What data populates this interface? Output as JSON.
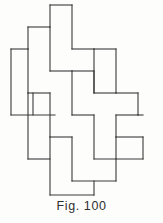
{
  "figure": {
    "caption": "Fig. 100",
    "title": "Fig. 100",
    "kind": "geometric-dissection-diagram",
    "background_color": "#fdfdfc",
    "stroke_color": "#3a3a3a",
    "stroke_width": 1.1,
    "fill_color": "none"
  },
  "canvas": {
    "width": 163,
    "height": 223,
    "drawing_bounds": {
      "left": 11,
      "top": 5,
      "right": 143,
      "bottom": 195
    },
    "grid_module": {
      "cell_width": 22,
      "cell_height": 22,
      "origin_x": 11,
      "origin_y": 5
    }
  },
  "chart_data": {
    "type": "diagram",
    "title": "Fig. 100",
    "subtitle": "",
    "xlabel": "",
    "ylabel": "",
    "grid": false,
    "legend": null,
    "units": "grid-cells of 22 x 22 px",
    "piece_count": 12,
    "piece_shape": "L-tetromino",
    "pieces": [
      {
        "id": "piece-1",
        "label": "top-centre",
        "points": "50,5 72,5 72,49 94,49 94,71 50,71"
      },
      {
        "id": "piece-2",
        "label": "upper-left-outer",
        "points": "28,27 50,27 50,71 72,71 72,93 28,93"
      },
      {
        "id": "piece-3",
        "label": "left-upper",
        "points": "11,49 33,49 33,93 55,93 55,115 11,115"
      },
      {
        "id": "piece-4",
        "label": "upper-right",
        "points": "94,49 116,49 116,93 138,93 138,115 94,115"
      },
      {
        "id": "piece-5",
        "label": "centre-upper",
        "points": "72,49 94,49 94,93 116,93 116,115 72,115"
      },
      {
        "id": "piece-6",
        "label": "centre-left",
        "points": "50,71 72,71 72,115 94,115 94,137 50,137"
      },
      {
        "id": "piece-7",
        "label": "left-lower",
        "points": "28,93 50,93 50,137 72,137 72,159 28,159"
      },
      {
        "id": "piece-8",
        "label": "centre-right",
        "points": "94,93 116,93 116,137 138,137 138,159 94,159"
      },
      {
        "id": "piece-9",
        "label": "right-mid",
        "points": "116,115 138,115 138,137 143,137 143,159 116,159"
      },
      {
        "id": "piece-10",
        "label": "centre-lower",
        "points": "72,115 94,115 94,159 116,159 116,181 72,181"
      },
      {
        "id": "piece-11",
        "label": "bottom-left",
        "points": "50,137 72,137 72,181 94,181 94,195 50,195"
      },
      {
        "id": "piece-12",
        "label": "bottom-centre",
        "points": "72,159 94,159 94,195 116,195 116,181 94,181"
      }
    ],
    "segments": [
      {
        "id": "s1",
        "x1": 50,
        "y1": 5,
        "x2": 72,
        "y2": 5
      },
      {
        "id": "s2",
        "x1": 50,
        "y1": 5,
        "x2": 50,
        "y2": 27
      },
      {
        "id": "s3",
        "x1": 72,
        "y1": 5,
        "x2": 72,
        "y2": 49
      },
      {
        "id": "s4",
        "x1": 28,
        "y1": 27,
        "x2": 50,
        "y2": 27
      },
      {
        "id": "s5",
        "x1": 28,
        "y1": 27,
        "x2": 28,
        "y2": 49
      },
      {
        "id": "s6",
        "x1": 50,
        "y1": 27,
        "x2": 50,
        "y2": 71
      },
      {
        "id": "s7",
        "x1": 11,
        "y1": 49,
        "x2": 28,
        "y2": 49
      },
      {
        "id": "s8",
        "x1": 11,
        "y1": 49,
        "x2": 11,
        "y2": 115
      },
      {
        "id": "s9",
        "x1": 28,
        "y1": 49,
        "x2": 28,
        "y2": 93
      },
      {
        "id": "s10",
        "x1": 72,
        "y1": 49,
        "x2": 94,
        "y2": 49
      },
      {
        "id": "s11",
        "x1": 94,
        "y1": 49,
        "x2": 94,
        "y2": 93
      },
      {
        "id": "s12",
        "x1": 94,
        "y1": 49,
        "x2": 116,
        "y2": 49
      },
      {
        "id": "s13",
        "x1": 116,
        "y1": 49,
        "x2": 116,
        "y2": 93
      },
      {
        "id": "s14",
        "x1": 50,
        "y1": 71,
        "x2": 72,
        "y2": 71
      },
      {
        "id": "s15",
        "x1": 72,
        "y1": 71,
        "x2": 72,
        "y2": 115
      },
      {
        "id": "s16",
        "x1": 28,
        "y1": 93,
        "x2": 50,
        "y2": 93
      },
      {
        "id": "s17",
        "x1": 50,
        "y1": 93,
        "x2": 50,
        "y2": 137
      },
      {
        "id": "s18",
        "x1": 94,
        "y1": 93,
        "x2": 116,
        "y2": 93
      },
      {
        "id": "s19",
        "x1": 116,
        "y1": 93,
        "x2": 138,
        "y2": 93
      },
      {
        "id": "s20",
        "x1": 138,
        "y1": 93,
        "x2": 138,
        "y2": 115
      },
      {
        "id": "s21",
        "x1": 11,
        "y1": 115,
        "x2": 55,
        "y2": 115
      },
      {
        "id": "s22",
        "x1": 72,
        "y1": 115,
        "x2": 94,
        "y2": 115
      },
      {
        "id": "s23",
        "x1": 94,
        "y1": 115,
        "x2": 94,
        "y2": 159
      },
      {
        "id": "s24",
        "x1": 116,
        "y1": 115,
        "x2": 138,
        "y2": 115
      },
      {
        "id": "s25",
        "x1": 116,
        "y1": 115,
        "x2": 116,
        "y2": 137
      },
      {
        "id": "s26",
        "x1": 138,
        "y1": 115,
        "x2": 143,
        "y2": 115
      },
      {
        "id": "s27",
        "x1": 33,
        "y1": 93,
        "x2": 33,
        "y2": 115
      },
      {
        "id": "s28",
        "x1": 50,
        "y1": 137,
        "x2": 72,
        "y2": 137
      },
      {
        "id": "s29",
        "x1": 72,
        "y1": 137,
        "x2": 72,
        "y2": 181
      },
      {
        "id": "s30",
        "x1": 116,
        "y1": 137,
        "x2": 143,
        "y2": 137
      },
      {
        "id": "s31",
        "x1": 143,
        "y1": 137,
        "x2": 143,
        "y2": 159
      },
      {
        "id": "s32",
        "x1": 28,
        "y1": 159,
        "x2": 50,
        "y2": 159
      },
      {
        "id": "s33",
        "x1": 94,
        "y1": 159,
        "x2": 143,
        "y2": 159
      },
      {
        "id": "s34",
        "x1": 116,
        "y1": 159,
        "x2": 116,
        "y2": 181
      },
      {
        "id": "s35",
        "x1": 72,
        "y1": 181,
        "x2": 116,
        "y2": 181
      },
      {
        "id": "s36",
        "x1": 50,
        "y1": 137,
        "x2": 50,
        "y2": 195
      },
      {
        "id": "s37",
        "x1": 50,
        "y1": 195,
        "x2": 94,
        "y2": 195
      },
      {
        "id": "s38",
        "x1": 94,
        "y1": 181,
        "x2": 94,
        "y2": 195
      },
      {
        "id": "s39",
        "x1": 28,
        "y1": 93,
        "x2": 28,
        "y2": 159
      },
      {
        "id": "s40",
        "x1": 94,
        "y1": 71,
        "x2": 94,
        "y2": 93
      },
      {
        "id": "s41",
        "x1": 72,
        "y1": 71,
        "x2": 94,
        "y2": 71
      },
      {
        "id": "s42",
        "x1": 116,
        "y1": 137,
        "x2": 116,
        "y2": 159
      }
    ]
  }
}
